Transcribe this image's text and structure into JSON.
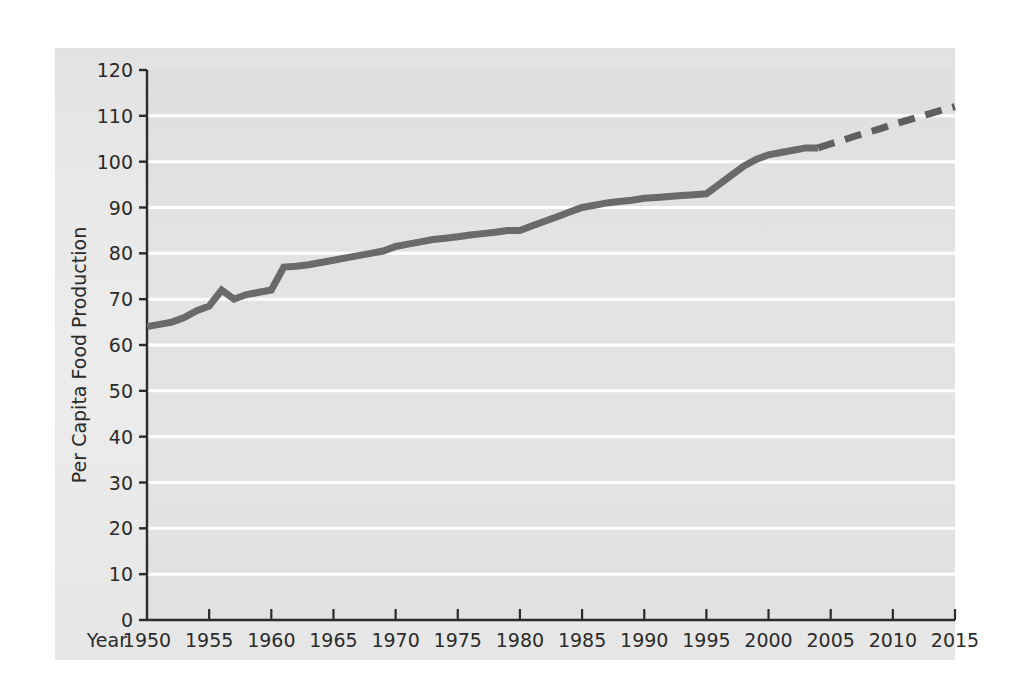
{
  "chart_data": {
    "type": "line",
    "title": "",
    "xlabel": "Year",
    "ylabel": "Per Capita Food Production",
    "xlim": [
      1950,
      2015
    ],
    "ylim": [
      0,
      120
    ],
    "grid": "horizontal-white-gridlines",
    "legend": "none",
    "xticks": [
      "1950",
      "1955",
      "1960",
      "1965",
      "1970",
      "1975",
      "1980",
      "1985",
      "1990",
      "1995",
      "2000",
      "2005",
      "2010",
      "2015"
    ],
    "yticks": [
      "0",
      "10",
      "20",
      "30",
      "40",
      "50",
      "60",
      "70",
      "80",
      "90",
      "100",
      "110",
      "120"
    ],
    "series": [
      {
        "name": "Per Capita Food Production (historical)",
        "style": "solid",
        "color": "#6a6a6a",
        "x": [
          1950,
          1951,
          1952,
          1953,
          1954,
          1955,
          1956,
          1957,
          1958,
          1959,
          1960,
          1961,
          1962,
          1963,
          1964,
          1965,
          1966,
          1967,
          1968,
          1969,
          1970,
          1971,
          1972,
          1973,
          1974,
          1975,
          1976,
          1977,
          1978,
          1979,
          1980,
          1981,
          1982,
          1983,
          1984,
          1985,
          1986,
          1987,
          1988,
          1989,
          1990,
          1991,
          1992,
          1993,
          1994,
          1995,
          1996,
          1997,
          1998,
          1999,
          2000,
          2001,
          2002,
          2003,
          2004
        ],
        "values": [
          64,
          64.5,
          65,
          66,
          67.5,
          68.5,
          72,
          70,
          71,
          71.5,
          72,
          77,
          77.2,
          77.5,
          78,
          78.5,
          79,
          79.5,
          80,
          80.5,
          81.5,
          82,
          82.5,
          83,
          83.3,
          83.6,
          84,
          84.3,
          84.6,
          85,
          85,
          86,
          87,
          88,
          89,
          90,
          90.5,
          91,
          91.3,
          91.6,
          92,
          92.2,
          92.4,
          92.6,
          92.8,
          93,
          95,
          97,
          99,
          100.5,
          101.5,
          102,
          102.5,
          103,
          103
        ]
      },
      {
        "name": "Per Capita Food Production (projected)",
        "style": "dashed",
        "color": "#5f5f5f",
        "x": [
          2004,
          2005,
          2006,
          2007,
          2008,
          2009,
          2010,
          2011,
          2012,
          2013,
          2014,
          2015
        ],
        "values": [
          103,
          103.9,
          104.7,
          105.6,
          106.4,
          107.2,
          108.1,
          108.9,
          109.7,
          110.5,
          111.3,
          112
        ]
      }
    ]
  },
  "figure": {
    "background_color": "#ffffff",
    "panel_color": "#e8e8e8",
    "gridline_color": "#ffffff",
    "axis_color": "#2b2b2b"
  }
}
